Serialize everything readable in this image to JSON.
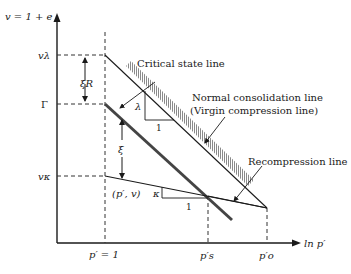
{
  "diagram": {
    "y_axis": {
      "label": "v = 1 + e"
    },
    "x_axis": {
      "label": "ln p′"
    },
    "y_ticks": [
      {
        "id": "v_lambda",
        "label": "vλ"
      },
      {
        "id": "gamma",
        "label": "Γ"
      },
      {
        "id": "v_kappa",
        "label": "vκ"
      }
    ],
    "x_ticks": [
      {
        "id": "p_unit",
        "label": "p′ = 1"
      },
      {
        "id": "p_s",
        "label": "p′s"
      },
      {
        "id": "p_o",
        "label": "p′o"
      }
    ],
    "lines": {
      "csl": "Critical state line",
      "ncl_1": "Normal consolidation line",
      "ncl_2": "(Virgin compression line)",
      "rcl": "Recompression line"
    },
    "annotations": {
      "xi_R": "ξR",
      "xi": "ξ",
      "point": "(p′, v)",
      "lambda": "λ",
      "kappa": "κ",
      "one_a": "1",
      "one_b": "1"
    }
  }
}
